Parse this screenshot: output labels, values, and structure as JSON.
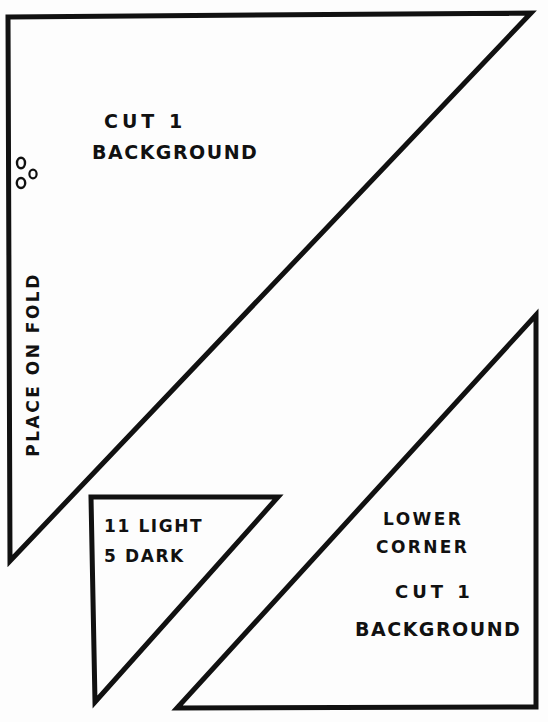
{
  "page": {
    "background_color": "#fdfdfd",
    "ink_color": "#111111",
    "width": 548,
    "height": 722,
    "kind": "hand-drawn quilt pattern template sheet"
  },
  "shapes": {
    "main_triangle": {
      "name": "background-main-triangle",
      "points": "8,17 531,13 10,561",
      "stroke_width": 5
    },
    "small_triangle": {
      "name": "light-dark-small-triangle",
      "points": "91,497 278,497 95,702",
      "stroke_width": 5
    },
    "lower_corner_triangle": {
      "name": "lower-corner-triangle",
      "points": "536,315 536,707 177,708",
      "stroke_width": 5
    },
    "fold_marks": {
      "name": "fold-circle-marks",
      "circles": [
        {
          "cx": 21,
          "cy": 163,
          "rx": 4.0,
          "ry": 5.2
        },
        {
          "cx": 33,
          "cy": 174,
          "rx": 3.6,
          "ry": 4.4
        },
        {
          "cx": 21,
          "cy": 183,
          "rx": 4.2,
          "ry": 5.0
        }
      ]
    }
  },
  "labels": {
    "main_piece": {
      "cut_count": "CUT 1",
      "fabric": "BACKGROUND",
      "fold_instruction": "PLACE ON FOLD"
    },
    "small_piece": {
      "light": "11 LIGHT",
      "dark": "5 DARK"
    },
    "lower_piece": {
      "name_line1": "LOWER",
      "name_line2": "CORNER",
      "cut_count": "CUT 1",
      "fabric": "BACKGROUND"
    }
  }
}
